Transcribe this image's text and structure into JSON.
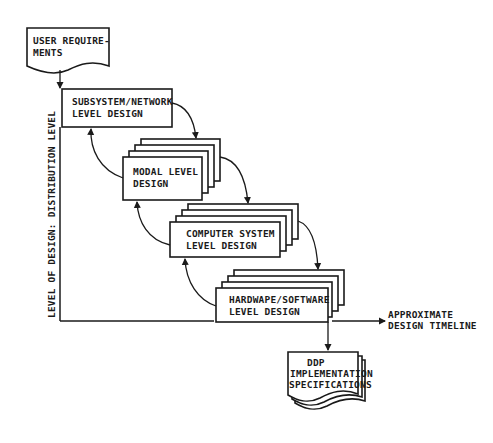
{
  "diagram": {
    "type": "waterfall-design-flow",
    "nodes": {
      "user_requirements": {
        "line1": "USER REQUIRE-",
        "line2": "MENTS",
        "shape": "document"
      },
      "subsystem": {
        "line1": "SUBSYSTEM/NETWORK",
        "line2": "LEVEL DESIGN",
        "shape": "process"
      },
      "modal": {
        "line1": "MODAL LEVEL",
        "line2": "DESIGN",
        "shape": "stacked-process"
      },
      "computer": {
        "line1": "COMPUTER SYSTEM",
        "line2": "LEVEL DESIGN",
        "shape": "stacked-process"
      },
      "hardware": {
        "line1": "HARDWAPE/SOFTWARE",
        "line2": "LEVEL DESIGN",
        "shape": "stacked-process"
      },
      "ddp": {
        "line1": "DDP",
        "line2": "IMPLEMENTATION",
        "line3": "SPECIFICATIONS",
        "shape": "multi-document"
      }
    },
    "axes": {
      "y_label": "LEVEL OF DESIGN:  DISTRIBUTION LEVEL",
      "x_label_line1": "APPROXIMATE",
      "x_label_line2": "DESIGN TIMELINE"
    },
    "edges": [
      {
        "from": "user_requirements",
        "to": "subsystem",
        "kind": "forward"
      },
      {
        "from": "subsystem",
        "to": "modal",
        "kind": "forward"
      },
      {
        "from": "modal",
        "to": "subsystem",
        "kind": "feedback"
      },
      {
        "from": "modal",
        "to": "computer",
        "kind": "forward"
      },
      {
        "from": "computer",
        "to": "modal",
        "kind": "feedback"
      },
      {
        "from": "computer",
        "to": "hardware",
        "kind": "forward"
      },
      {
        "from": "hardware",
        "to": "computer",
        "kind": "feedback"
      },
      {
        "from": "hardware",
        "to": "ddp",
        "kind": "forward"
      }
    ],
    "colors": {
      "ink": "#1a1a1a",
      "background": "#ffffff"
    }
  }
}
